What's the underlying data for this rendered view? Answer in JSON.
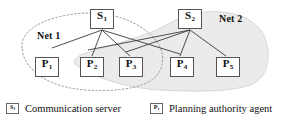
{
  "figure": {
    "colors": {
      "net1_outline": "#9a9a9a",
      "net2_fill": "#ebebeb",
      "net2_outline": "#d2d2d2",
      "edge": "#3a3a3a",
      "node_border": "#555555",
      "text": "#111111"
    }
  },
  "networks": [
    {
      "id": "net1",
      "label": "Net 1",
      "style": "dotted-outline",
      "x": 37,
      "y": 30
    },
    {
      "id": "net2",
      "label": "Net 2",
      "style": "gray-filled",
      "x": 219,
      "y": 13
    }
  ],
  "servers": [
    {
      "id": "S1",
      "base": "S",
      "sub": "1",
      "x": 90,
      "y": 9,
      "w": 24,
      "h": 20
    },
    {
      "id": "S2",
      "base": "S",
      "sub": "2",
      "x": 178,
      "y": 9,
      "w": 24,
      "h": 20
    }
  ],
  "agents": [
    {
      "id": "P1",
      "base": "P",
      "sub": "1",
      "x": 35,
      "y": 57,
      "w": 24,
      "h": 20
    },
    {
      "id": "P2",
      "base": "P",
      "sub": "2",
      "x": 80,
      "y": 57,
      "w": 24,
      "h": 20
    },
    {
      "id": "P3",
      "base": "P",
      "sub": "3",
      "x": 119,
      "y": 57,
      "w": 24,
      "h": 20
    },
    {
      "id": "P4",
      "base": "P",
      "sub": "4",
      "x": 170,
      "y": 57,
      "w": 24,
      "h": 20
    },
    {
      "id": "P5",
      "base": "P",
      "sub": "5",
      "x": 216,
      "y": 57,
      "w": 24,
      "h": 20
    }
  ],
  "edges": [
    {
      "from": "S1",
      "to": "P1"
    },
    {
      "from": "S1",
      "to": "P2"
    },
    {
      "from": "S1",
      "to": "P3"
    },
    {
      "from": "S1",
      "to": "P4"
    },
    {
      "from": "S2",
      "to": "P2"
    },
    {
      "from": "S2",
      "to": "P3"
    },
    {
      "from": "S2",
      "to": "P4"
    },
    {
      "from": "S2",
      "to": "P5"
    }
  ],
  "legend": [
    {
      "id": "legend-server",
      "base": "S",
      "sub": "i",
      "label": "Communication server",
      "x": 6,
      "y": 3
    },
    {
      "id": "legend-agent",
      "base": "P",
      "sub": "i",
      "label": "Planning authority agent",
      "x": 150,
      "y": 3
    }
  ]
}
